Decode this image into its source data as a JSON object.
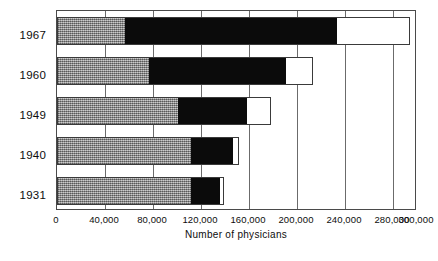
{
  "chart_data": {
    "type": "bar",
    "orientation": "horizontal",
    "stacked": true,
    "title": "",
    "subtitle": "",
    "xlabel": "Number of physicians",
    "ylabel": "",
    "xlim": [
      0,
      300000
    ],
    "xticks": [
      0,
      40000,
      80000,
      120000,
      160000,
      200000,
      240000,
      280000,
      300000
    ],
    "xtick_labels": [
      "0",
      "40,000",
      "80,000",
      "120,000",
      "160,000",
      "200,000",
      "240,000",
      "280,000",
      "300,000"
    ],
    "grid": "vertical",
    "legend": "none",
    "categories": [
      "1967",
      "1960",
      "1949",
      "1940",
      "1931"
    ],
    "series": [
      {
        "name": "segment-1",
        "fill": "gray-hatch",
        "color": "#9a9a9a",
        "values": [
          57000,
          77000,
          101000,
          112000,
          112000
        ]
      },
      {
        "name": "segment-2",
        "fill": "black",
        "color": "#0b0b0b",
        "values": [
          176000,
          114000,
          57000,
          35000,
          24000
        ]
      },
      {
        "name": "segment-3",
        "fill": "white",
        "color": "#ffffff",
        "values": [
          61000,
          22000,
          20000,
          5000,
          3000
        ]
      }
    ],
    "totals": [
      294000,
      213000,
      178000,
      152000,
      139000
    ],
    "cumulative": [
      [
        57000,
        233000,
        294000
      ],
      [
        77000,
        191000,
        213000
      ],
      [
        101000,
        158000,
        178000
      ],
      [
        112000,
        147000,
        152000
      ],
      [
        112000,
        136000,
        139000
      ]
    ]
  },
  "axis": {
    "y_labels": [
      {
        "label": "1967",
        "top": 20
      },
      {
        "label": "1960",
        "top": 60
      },
      {
        "label": "1949",
        "top": 100
      },
      {
        "label": "1940",
        "top": 140
      },
      {
        "label": "1931",
        "top": 180
      }
    ]
  },
  "bars": [
    {
      "category": "1967",
      "top": 6,
      "segments": [
        {
          "start": 0,
          "end": 57000
        },
        {
          "start": 57000,
          "end": 233000
        },
        {
          "start": 233000,
          "end": 294000
        }
      ]
    },
    {
      "category": "1960",
      "top": 46,
      "segments": [
        {
          "start": 0,
          "end": 77000
        },
        {
          "start": 77000,
          "end": 191000
        },
        {
          "start": 191000,
          "end": 213000
        }
      ]
    },
    {
      "category": "1949",
      "top": 86,
      "segments": [
        {
          "start": 0,
          "end": 101000
        },
        {
          "start": 101000,
          "end": 158000
        },
        {
          "start": 158000,
          "end": 178000
        }
      ]
    },
    {
      "category": "1940",
      "top": 126,
      "segments": [
        {
          "start": 0,
          "end": 112000
        },
        {
          "start": 112000,
          "end": 147000
        },
        {
          "start": 147000,
          "end": 152000
        }
      ]
    },
    {
      "category": "1931",
      "top": 166,
      "segments": [
        {
          "start": 0,
          "end": 112000
        },
        {
          "start": 112000,
          "end": 136000
        },
        {
          "start": 136000,
          "end": 139000
        }
      ]
    }
  ],
  "colors": {
    "segment_gray": "#9a9a9a",
    "segment_black": "#0b0b0b",
    "segment_white": "#ffffff",
    "frame": "#4a4a4a",
    "gridline": "#6b6b6b",
    "text": "#0d0d0d",
    "background": "#ffffff"
  }
}
